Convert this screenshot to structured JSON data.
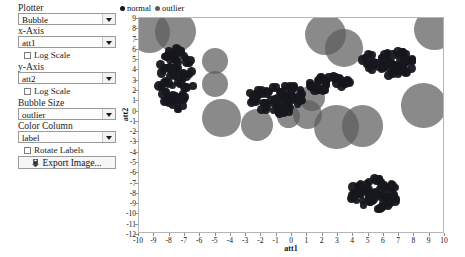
{
  "panel": {
    "plotter": {
      "label": "Plotter",
      "value": "Bubble"
    },
    "x_axis": {
      "label": "x-Axis",
      "value": "att1"
    },
    "x_log": {
      "label": "Log Scale",
      "checked": false
    },
    "y_axis": {
      "label": "y-Axis",
      "value": "att2"
    },
    "y_log": {
      "label": "Log Scale",
      "checked": false
    },
    "bubble_size": {
      "label": "Bubble Size",
      "value": "outlier"
    },
    "color_column": {
      "label": "Color Column",
      "value": "label"
    },
    "rotate_labels": {
      "label": "Rotate Labels",
      "checked": false
    },
    "export": {
      "label": "Export Image...",
      "icon": "save-disk-icon"
    }
  },
  "colors": {
    "normal": "#16161d",
    "outlier": "#5d5d5d",
    "frame": "#b6b6b6",
    "tick": "#111111"
  },
  "chart_data": {
    "type": "scatter",
    "title": "",
    "xlabel": "att1",
    "ylabel": "att2",
    "xlim": [
      -10,
      10
    ],
    "ylim": [
      -12,
      9
    ],
    "grid": false,
    "legend_position": "top-left",
    "xticks": [
      -10,
      -9,
      -8,
      -7,
      -6,
      -5,
      -4,
      -3,
      -2,
      -1,
      0,
      1,
      2,
      3,
      4,
      5,
      6,
      7,
      8,
      9,
      10
    ],
    "yticks": [
      9,
      8,
      7,
      6,
      5,
      4,
      3,
      2,
      1,
      0,
      -1,
      -2,
      -3,
      -4,
      -5,
      -6,
      -7,
      -8,
      -9,
      -10,
      -11,
      -12
    ],
    "legend": [
      {
        "name": "normal",
        "color": "#16161d"
      },
      {
        "name": "outlier",
        "color": "#5d5d5d"
      }
    ],
    "series": [
      {
        "name": "normal",
        "color": "#16161d",
        "marker": "circle",
        "size_px": 7,
        "note": "dense small-bubble clusters",
        "clusters": [
          {
            "cx": -7.6,
            "cy": 3.1,
            "rx": 1.25,
            "ry": 3.0,
            "n": 78
          },
          {
            "cx": -1.0,
            "cy": 1.2,
            "rx": 1.9,
            "ry": 1.5,
            "n": 66
          },
          {
            "cx": 6.3,
            "cy": 4.7,
            "rx": 1.9,
            "ry": 1.3,
            "n": 62
          },
          {
            "cx": 2.4,
            "cy": 2.6,
            "rx": 1.5,
            "ry": 0.8,
            "n": 30
          },
          {
            "cx": 5.3,
            "cy": -8.1,
            "rx": 1.7,
            "ry": 1.5,
            "n": 70
          }
        ]
      },
      {
        "name": "outlier",
        "color": "#5d5d5d",
        "marker": "circle",
        "note": "large sparse bubbles",
        "points": [
          {
            "x": -9.3,
            "y": 7.6,
            "r": 1.35
          },
          {
            "x": -7.6,
            "y": 7.7,
            "r": 1.35
          },
          {
            "x": -5.0,
            "y": 4.8,
            "r": 0.85
          },
          {
            "x": -5.0,
            "y": 2.6,
            "r": 0.85
          },
          {
            "x": -4.6,
            "y": -0.7,
            "r": 1.25
          },
          {
            "x": -2.3,
            "y": -1.4,
            "r": 1.05
          },
          {
            "x": -0.2,
            "y": -0.6,
            "r": 0.75
          },
          {
            "x": 1.0,
            "y": -0.4,
            "r": 0.95
          },
          {
            "x": 2.2,
            "y": 7.4,
            "r": 1.35
          },
          {
            "x": 3.4,
            "y": 6.1,
            "r": 1.25
          },
          {
            "x": 9.3,
            "y": 7.9,
            "r": 1.35
          },
          {
            "x": 2.9,
            "y": -1.6,
            "r": 1.45
          },
          {
            "x": 4.6,
            "y": -1.5,
            "r": 1.35
          },
          {
            "x": 8.6,
            "y": 0.5,
            "r": 1.45
          },
          {
            "x": 1.3,
            "y": 1.2,
            "r": 0.85
          }
        ]
      }
    ]
  }
}
